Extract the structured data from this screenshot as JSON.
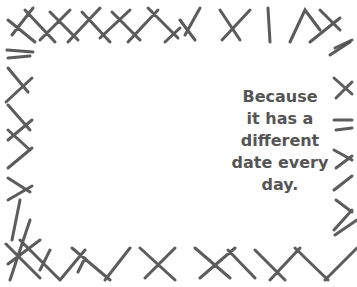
{
  "caption": {
    "lines": [
      "Because",
      "it has a",
      "different",
      "date every",
      "day."
    ]
  },
  "colors": {
    "stroke": "#444444",
    "text": "#555555",
    "background": "#ffffff"
  }
}
